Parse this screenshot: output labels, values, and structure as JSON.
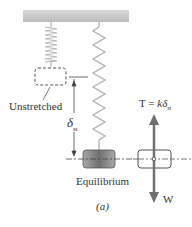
{
  "figure": {
    "caption": "(a)",
    "labels": {
      "unstretched": "Unstretched",
      "static_deflection_symbol": "δ",
      "static_deflection_subscript": "st",
      "tension_prefix": "T = ",
      "tension_k": "k",
      "tension_delta": "δ",
      "tension_subscript": "st",
      "equilibrium": "Equilibrium",
      "weight": "W"
    },
    "elements": {
      "ceiling": "fixed support",
      "spring_unstretched": "compressed coil spring (unstretched)",
      "spring_stretched": "zigzag spring (stretched)",
      "mass_unstretched_position": "dashed outline box",
      "mass_equilibrium": "shaded mass block",
      "free_body_diagram": "outlined block with force arrows"
    },
    "forces": [
      {
        "name": "tension",
        "direction": "up",
        "label": "T = kδst"
      },
      {
        "name": "weight",
        "direction": "down",
        "label": "W"
      }
    ],
    "colors": {
      "ceiling": "#c8c8c8",
      "spring": "#b0b0b0",
      "mass": "#8a8a8a",
      "arrow": "#6e6e6e",
      "line": "#444444",
      "text": "#333333"
    }
  }
}
